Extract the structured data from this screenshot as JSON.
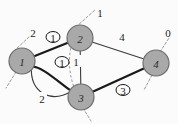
{
  "figure": {
    "kind": "graph-diagram",
    "background": "#fbfbfb",
    "node_fill": "#a9a9a9",
    "node_stroke": "#6d6d6d",
    "edge_color": "#1a1a1a",
    "thin_edge_color": "#3a3a3a",
    "dashed_color": "#9a9a9a"
  },
  "nodes": [
    {
      "id": "n1",
      "label": "1",
      "cx": 22,
      "cy": 61,
      "r": 13
    },
    {
      "id": "n2",
      "label": "2",
      "cx": 80,
      "cy": 38,
      "r": 13
    },
    {
      "id": "n3",
      "label": "3",
      "cx": 81,
      "cy": 97,
      "r": 13
    },
    {
      "id": "n4",
      "label": "4",
      "cx": 156,
      "cy": 63,
      "r": 13
    }
  ],
  "edges": [
    {
      "id": "e12",
      "from": "n1",
      "to": "n2",
      "style": "thick",
      "label": "1",
      "circled": true,
      "lx": 53,
      "ly": 37
    },
    {
      "id": "e13a",
      "from": "n1",
      "to": "n3",
      "style": "thick",
      "label": "1",
      "circled": true,
      "lx": 62,
      "ly": 62
    },
    {
      "id": "e13b",
      "from": "n1",
      "to": "n3",
      "style": "thin",
      "label": "2",
      "circled": false,
      "lx": 42,
      "ly": 98
    },
    {
      "id": "e23",
      "from": "n2",
      "to": "n3",
      "style": "thin",
      "label": "1",
      "circled": false,
      "lx": 76,
      "ly": 61
    },
    {
      "id": "e24",
      "from": "n2",
      "to": "n4",
      "style": "thin",
      "label": "4",
      "circled": false,
      "lx": 122,
      "ly": 36
    },
    {
      "id": "e34",
      "from": "n3",
      "to": "n4",
      "style": "thick",
      "label": "3",
      "circled": true,
      "lx": 123,
      "ly": 90
    }
  ],
  "external_labels": [
    {
      "id": "x1",
      "label": "2",
      "x": 33,
      "y": 33
    },
    {
      "id": "x2",
      "label": "1",
      "x": 100,
      "y": 13
    },
    {
      "id": "x3",
      "label": "0",
      "x": 168,
      "y": 33
    }
  ],
  "stub_lines": [
    {
      "id": "s1",
      "x1": 14,
      "y1": 51,
      "x2": 30,
      "y2": 36,
      "dashed": true
    },
    {
      "id": "s2",
      "x1": 16,
      "y1": 72,
      "x2": 6,
      "y2": 88,
      "dashed": true
    },
    {
      "id": "s3",
      "x1": 76,
      "y1": 27,
      "x2": 96,
      "y2": 9,
      "dashed": true
    },
    {
      "id": "s4",
      "x1": 160,
      "y1": 52,
      "x2": 169,
      "y2": 38,
      "dashed": true
    },
    {
      "id": "s5",
      "x1": 152,
      "y1": 75,
      "x2": 144,
      "y2": 90,
      "dashed": true
    },
    {
      "id": "s6",
      "x1": 83,
      "y1": 108,
      "x2": 91,
      "y2": 121,
      "dashed": true
    }
  ],
  "dashed_curve": {
    "id": "dc1",
    "path": "M 78 27 C 68 46, 66 70, 76 92"
  }
}
